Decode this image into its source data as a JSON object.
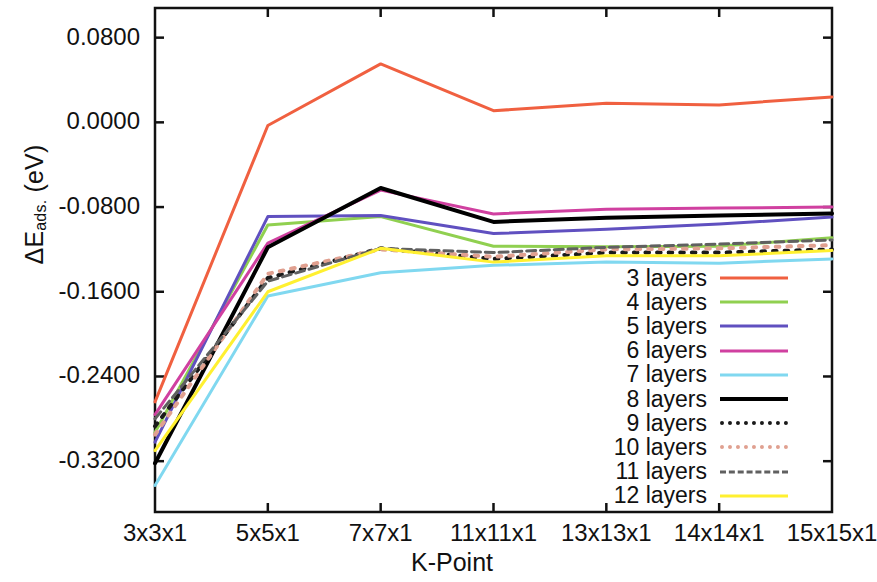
{
  "chart_data": {
    "type": "line",
    "title": "",
    "xlabel": "K-Point",
    "ylabel_prefix": "ΔE",
    "ylabel_sub": "ads.",
    "ylabel_suffix": " (eV)",
    "ylabel_full": "ΔEads. (eV)",
    "categories": [
      "3x3x1",
      "5x5x1",
      "7x7x1",
      "11x11x1",
      "13x13x1",
      "14x14x1",
      "15x15x1"
    ],
    "xtick_labels": [
      "3x3x1",
      "5x5x1",
      "7x7x1",
      "11x11x1",
      "13x13x1",
      "14x14x1",
      "15x15x1"
    ],
    "ytick_labels": [
      "0.0800",
      "0.0000",
      "-0.0800",
      "-0.1600",
      "-0.2400",
      "-0.3200"
    ],
    "ytick_values": [
      0.08,
      0.0,
      -0.08,
      -0.16,
      -0.24,
      -0.32
    ],
    "ylim": [
      -0.368,
      0.108
    ],
    "xlim_index": [
      0,
      6
    ],
    "grid": false,
    "legend_position": "lower-right-inside",
    "series": [
      {
        "name": "3 layers",
        "color": "#F06040",
        "style": "solid",
        "width": 3.0,
        "values": [
          -0.264,
          -0.003,
          0.0552,
          0.011,
          0.018,
          0.0165,
          0.024
        ]
      },
      {
        "name": "4 layers",
        "color": "#90D050",
        "style": "solid",
        "width": 3.0,
        "values": [
          -0.293,
          -0.097,
          -0.089,
          -0.117,
          -0.1175,
          -0.117,
          -0.109
        ]
      },
      {
        "name": "5 layers",
        "color": "#6050C0",
        "style": "solid",
        "width": 3.0,
        "values": [
          -0.302,
          -0.089,
          -0.088,
          -0.105,
          -0.101,
          -0.096,
          -0.0895
        ]
      },
      {
        "name": "6 layers",
        "color": "#D040A0",
        "style": "solid",
        "width": 3.0,
        "values": [
          -0.276,
          -0.114,
          -0.064,
          -0.0865,
          -0.082,
          -0.081,
          -0.08
        ]
      },
      {
        "name": "7 layers",
        "color": "#80D8F0",
        "style": "solid",
        "width": 3.0,
        "values": [
          -0.343,
          -0.164,
          -0.142,
          -0.135,
          -0.132,
          -0.133,
          -0.129
        ]
      },
      {
        "name": "8 layers",
        "color": "#000000",
        "style": "solid",
        "width": 4.0,
        "values": [
          -0.322,
          -0.118,
          -0.062,
          -0.094,
          -0.09,
          -0.088,
          -0.086
        ]
      },
      {
        "name": "9 layers",
        "color": "#1A1A1A",
        "style": "dotted",
        "width": 4.0,
        "values": [
          -0.287,
          -0.147,
          -0.119,
          -0.129,
          -0.123,
          -0.123,
          -0.12
        ]
      },
      {
        "name": "10 layers",
        "color": "#E0A090",
        "style": "dotted",
        "width": 4.0,
        "values": [
          -0.295,
          -0.143,
          -0.12,
          -0.127,
          -0.12,
          -0.119,
          -0.116
        ]
      },
      {
        "name": "11 layers",
        "color": "#606060",
        "style": "dashed",
        "width": 3.0,
        "values": [
          -0.28,
          -0.15,
          -0.119,
          -0.123,
          -0.118,
          -0.115,
          -0.111
        ]
      },
      {
        "name": "12 layers",
        "color": "#FFF030",
        "style": "solid",
        "width": 3.0,
        "values": [
          -0.31,
          -0.16,
          -0.119,
          -0.132,
          -0.126,
          -0.126,
          -0.121
        ]
      }
    ]
  },
  "legend": {
    "items": [
      {
        "label": "3 layers"
      },
      {
        "label": "4 layers"
      },
      {
        "label": "5 layers"
      },
      {
        "label": "6 layers"
      },
      {
        "label": "7 layers"
      },
      {
        "label": "8 layers"
      },
      {
        "label": "9 layers"
      },
      {
        "label": "10 layers"
      },
      {
        "label": "11 layers"
      },
      {
        "label": "12 layers"
      }
    ]
  }
}
